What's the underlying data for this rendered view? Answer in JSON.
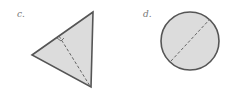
{
  "figures": [
    {
      "label": "c.",
      "shape": "right-triangle",
      "fill": "#dcdcdc",
      "stroke": "#555555",
      "annotation": "dashed altitude with right-angle marker"
    },
    {
      "label": "d.",
      "shape": "circle",
      "fill": "#dcdcdc",
      "stroke": "#555555",
      "annotation": "dashed diameter"
    }
  ]
}
